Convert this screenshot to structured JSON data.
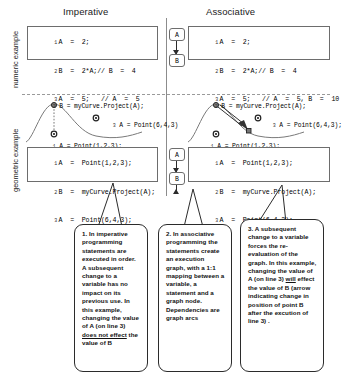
{
  "figure": {
    "columns": [
      {
        "id": "imperative",
        "label": "Imperative"
      },
      {
        "id": "associative",
        "label": "Associative"
      }
    ],
    "rows": [
      {
        "id": "numeric",
        "label": "numeric example"
      },
      {
        "id": "geometric",
        "label": "geometric example"
      }
    ]
  },
  "numeric": {
    "imperative": {
      "code": [
        {
          "n": "1",
          "text": "A  =  2;"
        },
        {
          "n": "2",
          "text": "B  =  2*A;// B  =  4"
        },
        {
          "n": "3",
          "text": "A  =  5;   // A  =  5"
        }
      ]
    },
    "associative": {
      "code": [
        {
          "n": "1",
          "text": "A  =  2;"
        },
        {
          "n": "2",
          "text": "B  =  2*A;// B  =  4"
        },
        {
          "n": "3",
          "text": "A  =  5;   // A  =  5, B  =  10"
        }
      ],
      "graph_nodes": [
        {
          "id": "node-a",
          "label": "A"
        },
        {
          "id": "node-b",
          "label": "B"
        }
      ]
    }
  },
  "geometric": {
    "imperative": {
      "captions": {
        "top": {
          "n": "2",
          "text": "B = myCurve.Project(A);"
        },
        "right": {
          "n": "3",
          "text": "A = Point(6,4,3)"
        },
        "bottom": {
          "n": "1",
          "text": "A = Point(1,2,3);"
        }
      },
      "code": [
        {
          "n": "1",
          "text": "A  =  Point(1,2,3);"
        },
        {
          "n": "2",
          "text": "B  =  myCurve.Project(A);"
        },
        {
          "n": "3",
          "text": "A  =  Point(6,4,3);"
        }
      ]
    },
    "associative": {
      "captions": {
        "top": {
          "n": "2",
          "text": "B = myCurve.Project(A);"
        },
        "right": {
          "n": "3",
          "text": "A = Point(6,4,3);"
        },
        "bottom": {
          "n": "1",
          "text": "A = Point(1,2,3);"
        }
      },
      "code": [
        {
          "n": "1",
          "text": "A  =  Point(1,2,3);"
        },
        {
          "n": "2",
          "text": "B  =  myCurve.Project(A);"
        },
        {
          "n": "3",
          "text": "A  =  Point(6,4,3);"
        }
      ],
      "graph_nodes": [
        {
          "id": "node-a",
          "label": "A"
        },
        {
          "id": "node-b",
          "label": "B"
        }
      ]
    }
  },
  "callouts": [
    {
      "id": "callout-1",
      "html": "1. In imperative programming statements are executed in order. A subsequent change to a variable has no impact on its previous use. In this example, changing the value of A (on line 3) <u>does not effect</u> the value of B"
    },
    {
      "id": "callout-2",
      "html": "2. In associative programming  the statements create an execution graph, with a 1:1 mapping between a variable, a statement and a  graph node. Dependencies are graph arcs"
    },
    {
      "id": "callout-3",
      "html": "3. A subsequent change to a variable forces the re-evaluation of the graph.  In this example, changing the value of A  (on line 3) <u>will</u> effect the value of B (arrow indicating change in position of point B after the excution of line 3) ."
    }
  ],
  "colors": {
    "line": "#6d6d6d",
    "arrow": "#2b2b2b",
    "text": "#111111",
    "background": "#ffffff"
  }
}
